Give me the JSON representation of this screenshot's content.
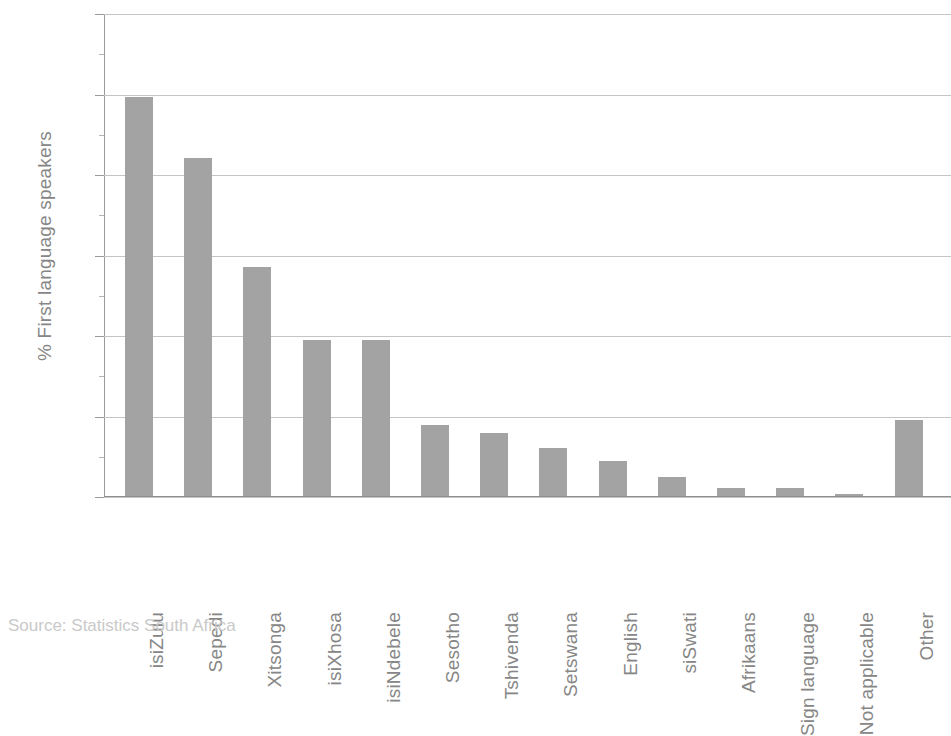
{
  "chart_data": {
    "type": "bar",
    "title": "",
    "xlabel": "",
    "ylabel": "% First language speakers",
    "ylim": [
      0,
      30
    ],
    "yticks": [
      0,
      5,
      10,
      15,
      20,
      25,
      30
    ],
    "grid": true,
    "legend": null,
    "bar_color": "#a3a3a3",
    "gridline_color": "#c4c4c4",
    "axis_color": "#9b9b9b",
    "categories": [
      "isiZulu",
      "Sepedi",
      "Xitsonga",
      "isiXhosa",
      "isiNdebele",
      "Sesotho",
      "Tshivenda",
      "Setswana",
      "English",
      "siSwati",
      "Afrikaans",
      "Sign language",
      "Not applicable",
      "Other"
    ],
    "values": [
      24.8,
      21.0,
      14.2,
      9.7,
      9.7,
      4.4,
      3.9,
      3.0,
      2.2,
      1.2,
      0.5,
      0.5,
      0.1,
      4.7
    ],
    "source": "Source: Statistics South Africa"
  }
}
